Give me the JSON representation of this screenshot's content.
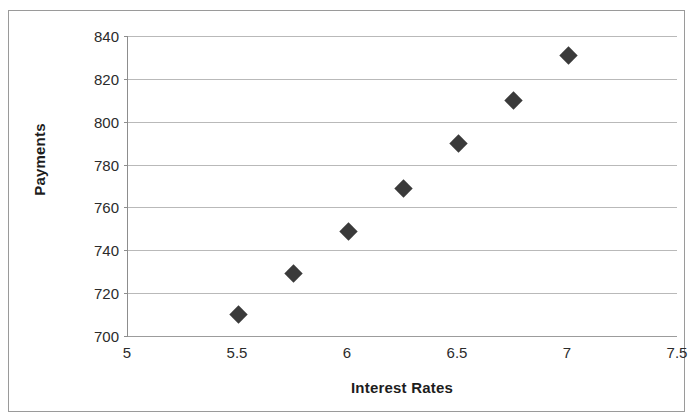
{
  "chart_data": {
    "type": "scatter",
    "title": "",
    "xlabel": "Interest Rates",
    "ylabel": "Payments",
    "xlim": [
      5,
      7.5
    ],
    "ylim": [
      700,
      840
    ],
    "xticks": [
      "5",
      "5.5",
      "6",
      "6.5",
      "7",
      "7.5"
    ],
    "xtick_values": [
      5,
      5.5,
      6,
      6.5,
      7,
      7.5
    ],
    "yticks": [
      "700",
      "720",
      "740",
      "760",
      "780",
      "800",
      "820",
      "840"
    ],
    "ytick_values": [
      700,
      720,
      740,
      760,
      780,
      800,
      820,
      840
    ],
    "grid": "horizontal",
    "legend": "none",
    "marker": "diamond",
    "marker_color": "#3a3a3a",
    "points": [
      {
        "x": 5.5,
        "y": 710
      },
      {
        "x": 5.75,
        "y": 729
      },
      {
        "x": 6.0,
        "y": 749
      },
      {
        "x": 6.25,
        "y": 769
      },
      {
        "x": 6.5,
        "y": 790
      },
      {
        "x": 6.75,
        "y": 810
      },
      {
        "x": 7.0,
        "y": 831
      }
    ]
  }
}
